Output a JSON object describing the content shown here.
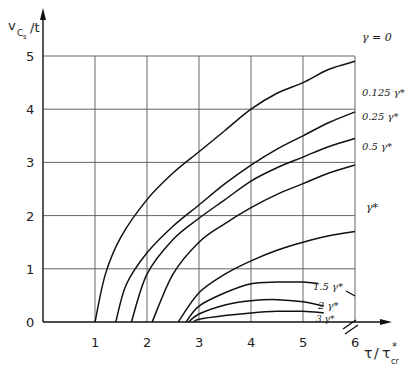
{
  "chart_data": {
    "type": "line",
    "title": "",
    "xlabel": "τ/τ*cr",
    "ylabel": "v_Cs/t",
    "xlim": [
      0,
      6
    ],
    "ylim": [
      0,
      5
    ],
    "x_ticks": [
      "1",
      "2",
      "3",
      "4",
      "5",
      "6"
    ],
    "y_ticks": [
      "0",
      "1",
      "2",
      "3",
      "4",
      "5"
    ],
    "grid": true,
    "legend_position": "right, inline labels at curve ends",
    "series": [
      {
        "name": "γ = 0",
        "label": "γ = 0",
        "x": [
          1.0,
          1.2,
          1.5,
          2.0,
          2.5,
          3.0,
          3.5,
          4.0,
          4.5,
          5.0,
          5.5,
          6.0
        ],
        "y": [
          0.0,
          0.9,
          1.6,
          2.3,
          2.8,
          3.2,
          3.6,
          4.0,
          4.3,
          4.5,
          4.75,
          4.9
        ]
      },
      {
        "name": "0.125 γ*",
        "label": "0.125 γ*",
        "x": [
          1.4,
          1.6,
          2.0,
          2.5,
          3.0,
          3.5,
          4.0,
          4.5,
          5.0,
          5.5,
          6.0
        ],
        "y": [
          0.0,
          0.7,
          1.3,
          1.8,
          2.2,
          2.6,
          2.95,
          3.25,
          3.5,
          3.75,
          3.95
        ]
      },
      {
        "name": "0.25 γ*",
        "label": "0.25 γ*",
        "x": [
          1.7,
          2.0,
          2.5,
          3.0,
          3.5,
          4.0,
          4.5,
          5.0,
          5.5,
          6.0
        ],
        "y": [
          0.0,
          0.9,
          1.55,
          1.95,
          2.3,
          2.65,
          2.9,
          3.1,
          3.3,
          3.45
        ]
      },
      {
        "name": "0.5 γ*",
        "label": "0.5 γ*",
        "x": [
          2.1,
          2.5,
          3.0,
          3.5,
          4.0,
          4.5,
          5.0,
          5.5,
          6.0
        ],
        "y": [
          0.0,
          0.9,
          1.5,
          1.85,
          2.15,
          2.4,
          2.6,
          2.8,
          2.95
        ]
      },
      {
        "name": "γ*",
        "label": "γ*",
        "x": [
          2.6,
          3.0,
          3.5,
          4.0,
          4.5,
          5.0,
          5.5,
          6.0
        ],
        "y": [
          0.0,
          0.55,
          0.9,
          1.15,
          1.35,
          1.5,
          1.62,
          1.7
        ]
      },
      {
        "name": "1.5 γ*",
        "label": "1.5 γ*",
        "x": [
          2.75,
          3.0,
          3.5,
          4.0,
          4.5,
          5.0,
          5.3
        ],
        "y": [
          0.0,
          0.3,
          0.55,
          0.72,
          0.75,
          0.75,
          0.72
        ]
      },
      {
        "name": "2 γ*",
        "label": "2 γ*",
        "x": [
          2.8,
          3.0,
          3.5,
          4.0,
          4.5,
          5.0,
          5.4
        ],
        "y": [
          0.0,
          0.15,
          0.32,
          0.4,
          0.42,
          0.38,
          0.3
        ]
      },
      {
        "name": "3 γ*",
        "label": "3 γ*",
        "x": [
          2.9,
          3.0,
          3.5,
          4.0,
          4.5,
          5.0,
          5.4
        ],
        "y": [
          0.0,
          0.05,
          0.12,
          0.17,
          0.2,
          0.2,
          0.17
        ]
      }
    ]
  },
  "axis": {
    "y_label_main": "v",
    "y_label_sub": "C",
    "y_label_subsub": "s",
    "y_label_tail": "/t",
    "x_label_main": "τ",
    "x_label_slash": "/",
    "x_label_tau": "τ",
    "x_label_star": "*",
    "x_label_sub": "cr"
  },
  "curve_labels": [
    {
      "text": "γ = 0"
    },
    {
      "text": "0.125 γ*"
    },
    {
      "text": "0.25 γ*"
    },
    {
      "text": "0.5 γ*"
    },
    {
      "text": "γ*"
    },
    {
      "text": "1.5 γ*"
    },
    {
      "text": "2 γ*"
    },
    {
      "text": "3 γ*"
    }
  ],
  "ticks": {
    "x": [
      "1",
      "2",
      "3",
      "4",
      "5",
      "6"
    ],
    "y": [
      "0",
      "1",
      "2",
      "3",
      "4",
      "5"
    ]
  }
}
